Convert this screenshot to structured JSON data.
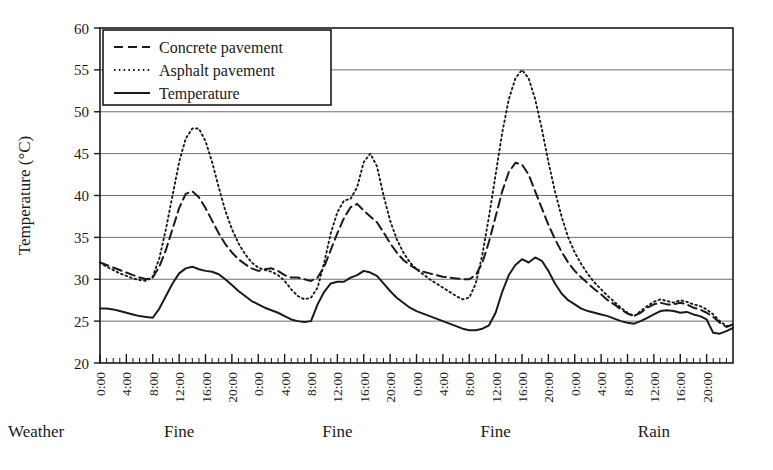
{
  "chart_data": {
    "type": "line",
    "title": "",
    "xlabel": "",
    "ylabel": "Temperature (°C)",
    "ylim": [
      20,
      60
    ],
    "ytick_labels": [
      "20",
      "25",
      "30",
      "35",
      "40",
      "45",
      "50",
      "55",
      "60"
    ],
    "ytick_values": [
      20,
      25,
      30,
      35,
      40,
      45,
      50,
      55,
      60
    ],
    "grid": "horizontal",
    "legend_position": "top-left",
    "xlim_hours": [
      0,
      96
    ],
    "xtick_step_hours": 4,
    "xtick_minor_step_hours": 1,
    "xtick_labels": [
      "0:00",
      "4:00",
      "8:00",
      "12:00",
      "16:00",
      "20:00",
      "0:00",
      "4:00",
      "8:00",
      "12:00",
      "16:00",
      "20:00",
      "0:00",
      "4:00",
      "8:00",
      "12:00",
      "16:00",
      "20:00",
      "0:00",
      "4:00",
      "8:00",
      "12:00",
      "16:00",
      "20:00"
    ],
    "weather_axis_label": "Weather",
    "weather_segments": [
      {
        "label": "Fine",
        "start_hour": 0,
        "end_hour": 24
      },
      {
        "label": "Fine",
        "start_hour": 24,
        "end_hour": 48
      },
      {
        "label": "Fine",
        "start_hour": 48,
        "end_hour": 72
      },
      {
        "label": "Rain",
        "start_hour": 72,
        "end_hour": 96
      }
    ],
    "series": [
      {
        "name": "Concrete pavement",
        "style": "dashed",
        "color": "#1a1a1a",
        "x": [
          0,
          1,
          2,
          3,
          4,
          5,
          6,
          7,
          8,
          9,
          10,
          11,
          12,
          13,
          14,
          15,
          16,
          17,
          18,
          19,
          20,
          21,
          22,
          23,
          24,
          25,
          26,
          27,
          28,
          29,
          30,
          31,
          32,
          33,
          34,
          35,
          36,
          37,
          38,
          39,
          40,
          41,
          42,
          43,
          44,
          45,
          46,
          47,
          48,
          49,
          50,
          51,
          52,
          53,
          54,
          55,
          56,
          57,
          58,
          59,
          60,
          61,
          62,
          63,
          64,
          65,
          66,
          67,
          68,
          69,
          70,
          71,
          72,
          73,
          74,
          75,
          76,
          77,
          78,
          79,
          80,
          81,
          82,
          83,
          84,
          85,
          86,
          87,
          88,
          89,
          90,
          91,
          92,
          93,
          94,
          95,
          96
        ],
        "values": [
          32.0,
          31.7,
          31.4,
          31.1,
          30.8,
          30.5,
          30.2,
          30.0,
          30.2,
          31.5,
          33.5,
          36.0,
          38.5,
          40.2,
          40.5,
          39.8,
          38.5,
          37.0,
          35.5,
          34.2,
          33.2,
          32.4,
          31.8,
          31.3,
          31.0,
          31.2,
          31.3,
          31.0,
          30.5,
          30.2,
          30.2,
          30.0,
          29.8,
          30.2,
          31.5,
          33.5,
          35.5,
          37.3,
          38.6,
          39.0,
          38.2,
          37.5,
          36.8,
          35.6,
          34.3,
          33.2,
          32.3,
          31.7,
          31.2,
          30.9,
          30.7,
          30.5,
          30.3,
          30.2,
          30.1,
          30.0,
          30.0,
          30.5,
          32.0,
          34.5,
          37.5,
          40.5,
          42.8,
          43.9,
          43.7,
          42.5,
          40.5,
          38.5,
          36.5,
          34.8,
          33.3,
          32.0,
          31.0,
          30.2,
          29.5,
          28.8,
          28.2,
          27.5,
          27.0,
          26.4,
          25.9,
          25.6,
          26.0,
          26.6,
          27.0,
          27.2,
          27.0,
          27.0,
          27.2,
          27.0,
          26.6,
          26.4,
          26.0,
          25.5,
          24.8,
          24.3,
          24.6
        ]
      },
      {
        "name": "Asphalt pavement",
        "style": "dotted",
        "color": "#1a1a1a",
        "x": [
          0,
          1,
          2,
          3,
          4,
          5,
          6,
          7,
          8,
          9,
          10,
          11,
          12,
          13,
          14,
          15,
          16,
          17,
          18,
          19,
          20,
          21,
          22,
          23,
          24,
          25,
          26,
          27,
          28,
          29,
          30,
          31,
          32,
          33,
          34,
          35,
          36,
          37,
          38,
          39,
          40,
          41,
          42,
          43,
          44,
          45,
          46,
          47,
          48,
          49,
          50,
          51,
          52,
          53,
          54,
          55,
          56,
          57,
          58,
          59,
          60,
          61,
          62,
          63,
          64,
          65,
          66,
          67,
          68,
          69,
          70,
          71,
          72,
          73,
          74,
          75,
          76,
          77,
          78,
          79,
          80,
          81,
          82,
          83,
          84,
          85,
          86,
          87,
          88,
          89,
          90,
          91,
          92,
          93,
          94,
          95,
          96
        ],
        "values": [
          32.0,
          31.5,
          31.1,
          30.7,
          30.4,
          30.1,
          29.9,
          29.8,
          30.3,
          32.5,
          36.0,
          40.0,
          44.0,
          46.8,
          48.0,
          48.0,
          46.5,
          44.0,
          41.0,
          38.2,
          36.0,
          34.3,
          33.0,
          32.0,
          31.4,
          31.1,
          30.9,
          30.5,
          29.8,
          28.8,
          28.0,
          27.6,
          27.8,
          29.0,
          32.0,
          35.5,
          38.0,
          39.4,
          39.6,
          41.0,
          44.0,
          45.0,
          43.5,
          40.0,
          37.0,
          34.8,
          33.2,
          32.0,
          31.2,
          30.6,
          30.0,
          29.5,
          29.0,
          28.5,
          28.0,
          27.6,
          27.8,
          29.5,
          33.0,
          37.5,
          42.5,
          47.5,
          51.5,
          54.0,
          55.0,
          54.0,
          51.5,
          48.0,
          44.0,
          40.5,
          37.5,
          35.0,
          33.2,
          31.8,
          30.6,
          29.6,
          28.8,
          28.0,
          27.3,
          26.6,
          26.0,
          25.6,
          26.2,
          26.8,
          27.3,
          27.6,
          27.4,
          27.2,
          27.5,
          27.3,
          27.0,
          26.8,
          26.4,
          25.8,
          25.0,
          24.4,
          24.6
        ]
      },
      {
        "name": "Temperature",
        "style": "solid",
        "color": "#1a1a1a",
        "x": [
          0,
          1,
          2,
          3,
          4,
          5,
          6,
          7,
          8,
          9,
          10,
          11,
          12,
          13,
          14,
          15,
          16,
          17,
          18,
          19,
          20,
          21,
          22,
          23,
          24,
          25,
          26,
          27,
          28,
          29,
          30,
          31,
          32,
          33,
          34,
          35,
          36,
          37,
          38,
          39,
          40,
          41,
          42,
          43,
          44,
          45,
          46,
          47,
          48,
          49,
          50,
          51,
          52,
          53,
          54,
          55,
          56,
          57,
          58,
          59,
          60,
          61,
          62,
          63,
          64,
          65,
          66,
          67,
          68,
          69,
          70,
          71,
          72,
          73,
          74,
          75,
          76,
          77,
          78,
          79,
          80,
          81,
          82,
          83,
          84,
          85,
          86,
          87,
          88,
          89,
          90,
          91,
          92,
          93,
          94,
          95,
          96
        ],
        "values": [
          26.5,
          26.5,
          26.4,
          26.2,
          26.0,
          25.8,
          25.6,
          25.5,
          25.4,
          26.5,
          28.0,
          29.5,
          30.7,
          31.3,
          31.5,
          31.2,
          31.0,
          30.9,
          30.6,
          30.0,
          29.3,
          28.6,
          28.0,
          27.4,
          27.0,
          26.6,
          26.3,
          26.0,
          25.6,
          25.2,
          25.0,
          24.9,
          25.0,
          27.0,
          28.5,
          29.5,
          29.7,
          29.7,
          30.2,
          30.5,
          31.0,
          30.8,
          30.4,
          29.5,
          28.6,
          27.8,
          27.2,
          26.6,
          26.2,
          25.9,
          25.6,
          25.3,
          25.0,
          24.7,
          24.4,
          24.1,
          23.9,
          23.9,
          24.1,
          24.5,
          26.0,
          28.5,
          30.5,
          31.7,
          32.4,
          32.0,
          32.6,
          32.2,
          31.0,
          29.5,
          28.3,
          27.5,
          27.0,
          26.5,
          26.2,
          26.0,
          25.8,
          25.6,
          25.3,
          25.0,
          24.8,
          24.7,
          25.0,
          25.4,
          25.8,
          26.2,
          26.3,
          26.2,
          26.0,
          26.1,
          25.8,
          25.6,
          25.2,
          23.6,
          23.5,
          23.8,
          24.2
        ]
      }
    ]
  },
  "legend": {
    "items": [
      {
        "label": "Concrete pavement",
        "style": "dashed"
      },
      {
        "label": "Asphalt pavement",
        "style": "dotted"
      },
      {
        "label": "Temperature",
        "style": "solid"
      }
    ]
  }
}
